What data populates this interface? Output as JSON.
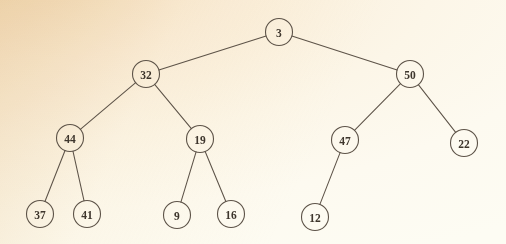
{
  "diagram": {
    "type": "binary-tree",
    "background_color": "#faeeda",
    "stroke_color": "#5d5348",
    "text_color": "#3d352c",
    "node_radius": 13.5,
    "nodes": [
      {
        "id": "n3",
        "label": "3",
        "x": 279,
        "y": 32,
        "level": 0
      },
      {
        "id": "n32",
        "label": "32",
        "x": 146,
        "y": 74,
        "level": 1
      },
      {
        "id": "n50",
        "label": "50",
        "x": 410,
        "y": 74,
        "level": 1
      },
      {
        "id": "n44",
        "label": "44",
        "x": 70,
        "y": 138,
        "level": 2
      },
      {
        "id": "n19",
        "label": "19",
        "x": 200,
        "y": 139,
        "level": 2
      },
      {
        "id": "n47",
        "label": "47",
        "x": 345,
        "y": 140,
        "level": 2
      },
      {
        "id": "n22",
        "label": "22",
        "x": 464,
        "y": 143,
        "level": 2
      },
      {
        "id": "n37",
        "label": "37",
        "x": 40,
        "y": 214,
        "level": 3
      },
      {
        "id": "n41",
        "label": "41",
        "x": 87,
        "y": 214,
        "level": 3
      },
      {
        "id": "n9",
        "label": "9",
        "x": 177,
        "y": 215,
        "level": 3
      },
      {
        "id": "n16",
        "label": "16",
        "x": 231,
        "y": 214,
        "level": 3
      },
      {
        "id": "n12",
        "label": "12",
        "x": 315,
        "y": 217,
        "level": 3
      }
    ],
    "edges": [
      {
        "from": "n3",
        "to": "n32"
      },
      {
        "from": "n3",
        "to": "n50"
      },
      {
        "from": "n32",
        "to": "n44"
      },
      {
        "from": "n32",
        "to": "n19"
      },
      {
        "from": "n50",
        "to": "n47"
      },
      {
        "from": "n50",
        "to": "n22"
      },
      {
        "from": "n44",
        "to": "n37"
      },
      {
        "from": "n44",
        "to": "n41"
      },
      {
        "from": "n19",
        "to": "n9"
      },
      {
        "from": "n19",
        "to": "n16"
      },
      {
        "from": "n47",
        "to": "n12"
      }
    ]
  }
}
